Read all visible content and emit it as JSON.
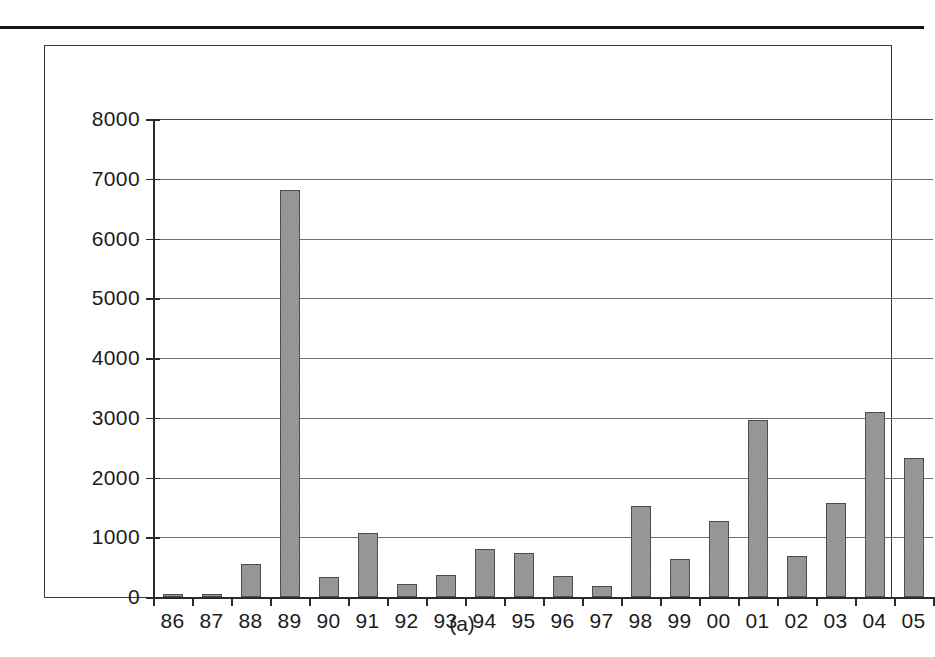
{
  "figure": {
    "caption": "(a)",
    "bar_color": "#9c9c9c",
    "bar_border_color": "#4d4d4d",
    "gridline_color": "#6e6e6e",
    "axis_color": "#2a2a2a"
  },
  "chart_data": {
    "type": "bar",
    "title": "",
    "subtitle": "",
    "xlabel": "",
    "ylabel": "",
    "categories": [
      "86",
      "87",
      "88",
      "89",
      "90",
      "91",
      "92",
      "93",
      "94",
      "95",
      "96",
      "97",
      "98",
      "99",
      "00",
      "01",
      "02",
      "03",
      "04",
      "05"
    ],
    "values": [
      45,
      55,
      555,
      6815,
      340,
      1075,
      215,
      370,
      810,
      730,
      345,
      180,
      1520,
      640,
      1280,
      2960,
      680,
      1570,
      3100,
      2330
    ],
    "ylim": [
      0,
      8000
    ],
    "ytick_labels": [
      "8000",
      "7000",
      "6000",
      "5000",
      "4000",
      "3000",
      "2000",
      "1000",
      "0"
    ],
    "ytick_values": [
      8000,
      7000,
      6000,
      5000,
      4000,
      3000,
      2000,
      1000,
      0
    ],
    "grid": true,
    "legend": null,
    "legend_position": "none",
    "annotations": []
  }
}
